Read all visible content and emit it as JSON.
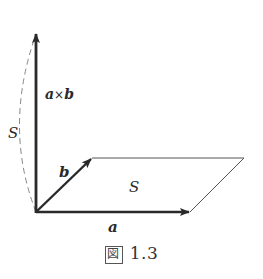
{
  "figure": {
    "caption_prefix": "図",
    "caption_number": "1.3",
    "labels": {
      "cross_product": "a×b",
      "cross_a": "a",
      "cross_times": "×",
      "cross_b": "b",
      "vector_a": "a",
      "vector_b": "b",
      "area_parallelogram": "S",
      "area_arc": "S"
    },
    "geometry": {
      "origin": [
        36,
        212
      ],
      "vector_a_tip": [
        190,
        212
      ],
      "vector_b_tip": [
        92,
        158
      ],
      "cross_product_tip": [
        36,
        32
      ],
      "parallelogram": [
        [
          36,
          212
        ],
        [
          190,
          212
        ],
        [
          244,
          158
        ],
        [
          92,
          158
        ]
      ]
    },
    "colors": {
      "vector": "#2a2a2a",
      "outline": "#555555",
      "dashed_arc": "#888888"
    }
  }
}
